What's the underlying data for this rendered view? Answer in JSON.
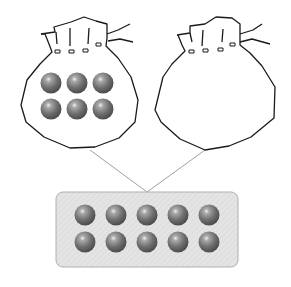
{
  "diagram": {
    "left_bag": {
      "ball_count": 6,
      "rows": 2,
      "cols": 3
    },
    "right_bag": {
      "ball_count": 0
    },
    "box": {
      "ball_count": 10,
      "rows": 2,
      "cols": 5
    },
    "colors": {
      "outline": "#1a1a1a",
      "ball": "#6e6e6e",
      "ball_highlight": "#e6e6e6",
      "box_fill": "#e2e2e2",
      "box_stroke": "#b5b5b5",
      "connector": "#9a9a9a"
    }
  }
}
